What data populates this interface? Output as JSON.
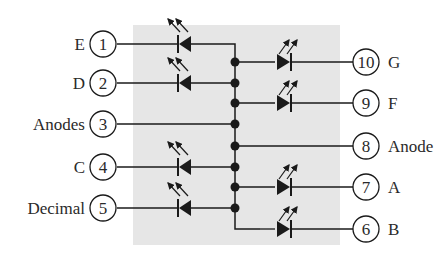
{
  "diagram": {
    "type": "common-anode seven-segment LED display pinout",
    "colors": {
      "package": "#e6e6e6",
      "ink": "#1a1a1a"
    },
    "left_pins": [
      {
        "pin": "1",
        "label": "E",
        "y": 44,
        "led": true
      },
      {
        "pin": "2",
        "label": "D",
        "y": 83,
        "led": true
      },
      {
        "pin": "3",
        "label": "Anodes",
        "y": 124,
        "led": false
      },
      {
        "pin": "4",
        "label": "C",
        "y": 167,
        "led": true
      },
      {
        "pin": "5",
        "label": "Decimal",
        "y": 208,
        "led": true
      }
    ],
    "right_pins": [
      {
        "pin": "10",
        "label": "G",
        "y": 62,
        "led": true
      },
      {
        "pin": "9",
        "label": "F",
        "y": 103,
        "led": true
      },
      {
        "pin": "8",
        "label": "Anode",
        "y": 146,
        "led": false
      },
      {
        "pin": "7",
        "label": "A",
        "y": 187,
        "led": true
      },
      {
        "pin": "6",
        "label": "B",
        "y": 229,
        "led": true
      }
    ]
  }
}
